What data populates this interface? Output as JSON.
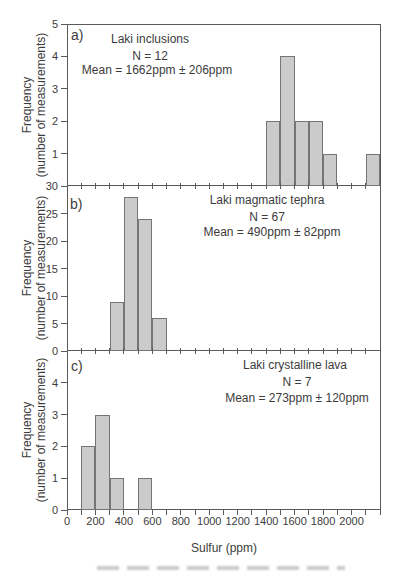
{
  "figure": {
    "xlabel": "Sulfur (ppm)",
    "ylabel_line1": "Frequency",
    "ylabel_line2": "(number of measurements)",
    "colors": {
      "bar_fill": "#cbcbcb",
      "bar_stroke": "#757575",
      "axis": "#5a5a5a",
      "text": "#3c3c3c"
    },
    "x_axis": {
      "min": 0,
      "max": 2200,
      "tick_step": 100,
      "label_step": 200,
      "tick_labels": [
        "0",
        "200",
        "400",
        "600",
        "800",
        "1000",
        "1200",
        "1400",
        "1600",
        "1800",
        "2000"
      ]
    }
  },
  "chart_data": [
    {
      "type": "bar",
      "panel_tag": "a)",
      "title": "Laki inclusions",
      "n_label": "N = 12",
      "mean_label": "Mean = 1662ppm ± 206ppm",
      "n": 12,
      "mean_ppm": 1662,
      "std_ppm": 206,
      "ylim": [
        0,
        5
      ],
      "yticks": [
        1,
        2,
        3,
        4,
        5
      ],
      "bin_width_ppm": 100,
      "bins": [
        {
          "x0_ppm": 1400,
          "count": 2
        },
        {
          "x0_ppm": 1500,
          "count": 4
        },
        {
          "x0_ppm": 1600,
          "count": 2
        },
        {
          "x0_ppm": 1700,
          "count": 2
        },
        {
          "x0_ppm": 1800,
          "count": 1
        },
        {
          "x0_ppm": 2100,
          "count": 1
        }
      ]
    },
    {
      "type": "bar",
      "panel_tag": "b)",
      "title": "Laki magmatic tephra",
      "n_label": "N = 67",
      "mean_label": "Mean = 490ppm ± 82ppm",
      "n": 67,
      "mean_ppm": 490,
      "std_ppm": 82,
      "ylim": [
        0,
        30
      ],
      "yticks": [
        0,
        5,
        10,
        15,
        20,
        25,
        30
      ],
      "bin_width_ppm": 100,
      "bins": [
        {
          "x0_ppm": 300,
          "count": 9
        },
        {
          "x0_ppm": 400,
          "count": 28
        },
        {
          "x0_ppm": 500,
          "count": 24
        },
        {
          "x0_ppm": 600,
          "count": 6
        }
      ]
    },
    {
      "type": "bar",
      "panel_tag": "c)",
      "title": "Laki crystalline lava",
      "n_label": "N = 7",
      "mean_label": "Mean = 273ppm ± 120ppm",
      "n": 7,
      "mean_ppm": 273,
      "std_ppm": 120,
      "ylim": [
        0,
        5
      ],
      "yticks": [
        0,
        1,
        2,
        3,
        4
      ],
      "bin_width_ppm": 100,
      "bins": [
        {
          "x0_ppm": 100,
          "count": 2
        },
        {
          "x0_ppm": 200,
          "count": 3
        },
        {
          "x0_ppm": 300,
          "count": 1
        },
        {
          "x0_ppm": 500,
          "count": 1
        }
      ]
    }
  ]
}
